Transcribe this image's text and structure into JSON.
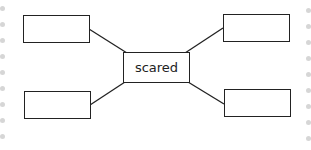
{
  "diagram": {
    "type": "mind-map",
    "center": {
      "label": "scared"
    },
    "branches": [
      {
        "position": "top-left",
        "label": ""
      },
      {
        "position": "top-right",
        "label": ""
      },
      {
        "position": "bottom-left",
        "label": ""
      },
      {
        "position": "bottom-right",
        "label": ""
      }
    ],
    "colors": {
      "stroke": "#222222",
      "background": "#ffffff",
      "edge_dots": "#d6d6d6"
    }
  }
}
